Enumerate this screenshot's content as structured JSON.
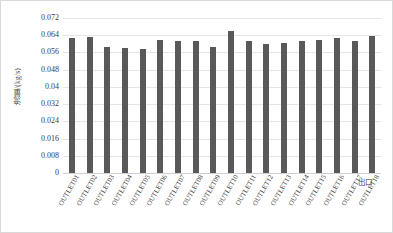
{
  "chart_data": {
    "type": "bar",
    "title": "",
    "xlabel": "出口",
    "ylabel": "流量/(kg/s)",
    "categories": [
      "OUTLET01",
      "OUTLET02",
      "OUTLET03",
      "OUTLET04",
      "OUTLET05",
      "OUTLET06",
      "OUTLET07",
      "OUTLET08",
      "OUTLET09",
      "OUTLET10",
      "OUTLET11",
      "OUTLET12",
      "OUTLET13",
      "OUTLET14",
      "OUTLET15",
      "OUTLET16",
      "OUTLET17",
      "OUTLET18"
    ],
    "values": [
      0.0627,
      0.0632,
      0.0585,
      0.0582,
      0.0574,
      0.062,
      0.0615,
      0.0615,
      0.0585,
      0.066,
      0.0615,
      0.06,
      0.0605,
      0.0612,
      0.062,
      0.0627,
      0.0615,
      0.0637
    ],
    "ylim": [
      0,
      0.072
    ],
    "yticks": [
      0,
      0.008,
      0.016,
      0.024,
      0.032,
      0.04,
      0.048,
      0.056,
      0.064,
      0.072
    ],
    "ytick_labels": [
      "0",
      "0.008",
      "0.016",
      "0.024",
      "0.032",
      "0.04",
      "0.048",
      "0.056",
      "0.064",
      "0.072"
    ],
    "grid": true,
    "legend": false,
    "bar_color": "#595959",
    "gridline_color": "#e6e6e6",
    "axis_text_color": "#404040",
    "border_color": "#d9d9d9",
    "background": "#ffffff"
  }
}
